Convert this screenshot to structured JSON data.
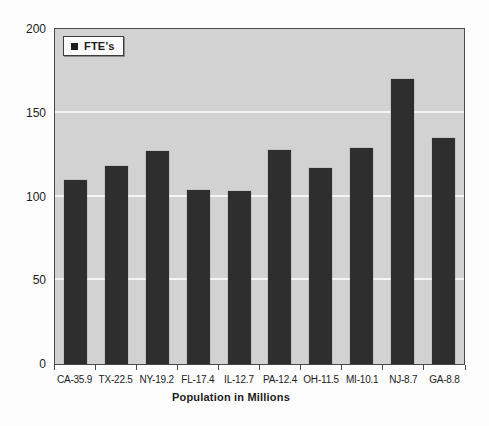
{
  "chart_data": {
    "type": "bar",
    "title": "",
    "xlabel": "Population in Millions",
    "ylabel": "",
    "categories": [
      "CA-35.9",
      "TX-22.5",
      "NY-19.2",
      "FL-17.4",
      "IL-12.7",
      "PA-12.4",
      "OH-11.5",
      "MI-10.1",
      "NJ-8.7",
      "GA-8.8"
    ],
    "series": [
      {
        "name": "FTE's",
        "values": [
          110,
          118,
          127,
          104,
          103,
          128,
          117,
          129,
          170,
          135
        ]
      }
    ],
    "ylim": [
      0,
      200
    ],
    "yticks": [
      0,
      50,
      100,
      150,
      200
    ],
    "ytick_labels": [
      "0",
      "50",
      "100",
      "150",
      "200"
    ],
    "gridlines": [
      50,
      100,
      150
    ],
    "grid": true,
    "legend_position": "top-left"
  },
  "legend": {
    "label": "FTE's",
    "marker": "black-square"
  },
  "colors": {
    "bar": "#2e2e2e",
    "plot_background": "#d2d2d2",
    "gridline": "#f4f4f4",
    "axis": "#4a4a4a",
    "outer_background": "#fdfdfd",
    "text": "#1c1c1c"
  }
}
